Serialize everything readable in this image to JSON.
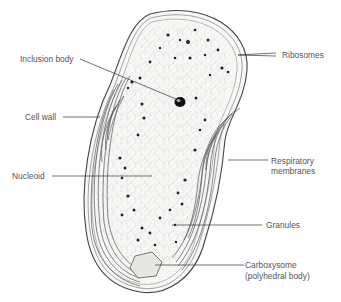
{
  "diagram": {
    "labels": {
      "inclusion_body": "Inclusion body",
      "cell_wall": "Cell wall",
      "nucleoid": "Nucleoid",
      "ribosomes": "Ribosomes",
      "respiratory_membranes_line1": "Respiratory",
      "respiratory_membranes_line2": "membranes",
      "granules": "Granules",
      "carboxysome_line1": "Carboxysome",
      "carboxysome_line2": "(polyhedral body)"
    },
    "colors": {
      "ink": "#333333",
      "label_text": "#555555",
      "cytoplasm": "#f4f4f2",
      "background": "#ffffff"
    }
  }
}
